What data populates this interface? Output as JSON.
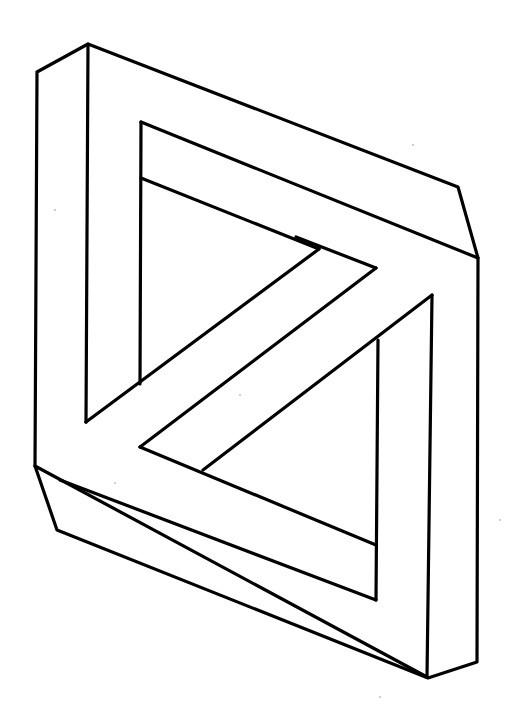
{
  "figure": {
    "title": "",
    "colors": {
      "background": "#ffffff",
      "line": "#000000"
    },
    "edges": [
      {
        "name": "outer-top-left-bevel",
        "from": "A",
        "to": "B"
      },
      {
        "name": "outer-top-edge",
        "from": "B",
        "to": "C"
      },
      {
        "name": "outer-right-bevel",
        "from": "C",
        "to": "D"
      },
      {
        "name": "outer-right-edge",
        "from": "D",
        "to": "E"
      },
      {
        "name": "outer-bottom-right-bevel",
        "from": "E",
        "to": "F"
      },
      {
        "name": "outer-bottom-edge",
        "from": "F",
        "to": "G"
      },
      {
        "name": "outer-bottom-left-bevel",
        "from": "G",
        "to": "H"
      },
      {
        "name": "outer-left-edge",
        "from": "H",
        "to": "A"
      },
      {
        "name": "front-vertical-edge",
        "from": "B",
        "to": "I"
      },
      {
        "name": "top-crease-edge",
        "from": "D",
        "to": "J"
      },
      {
        "name": "bottom-crease-edge",
        "from": "H",
        "to": "F"
      },
      {
        "name": "front-vertical-lower",
        "from": "F",
        "to": "K"
      },
      {
        "name": "inner-top-left-vertical",
        "from": "L",
        "to": "M"
      },
      {
        "name": "inner-top-edge",
        "from": "L",
        "to": "N"
      },
      {
        "name": "inner-shelf-edge",
        "from": "O",
        "to": "P"
      },
      {
        "name": "diagonal-bar-upper",
        "from": "P",
        "to": "I"
      },
      {
        "name": "diagonal-bar-lower",
        "from": "N",
        "to": "Q"
      },
      {
        "name": "inner-bottom-edge",
        "from": "Q",
        "to": "R"
      },
      {
        "name": "inner-diagonal-short",
        "from": "S",
        "to": "K"
      },
      {
        "name": "inner-right-vertical",
        "from": "T",
        "to": "R2"
      },
      {
        "name": "inner-lower-shelf",
        "from": "U",
        "to": "R2"
      }
    ],
    "vertex_labels": []
  }
}
